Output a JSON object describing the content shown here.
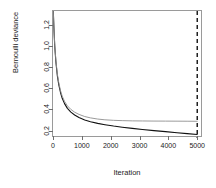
{
  "chart_data": {
    "type": "line",
    "title": "",
    "xlabel": "Iteration",
    "ylabel": "Bernoulli deviance",
    "xlim": [
      0,
      5200
    ],
    "ylim": [
      0.13,
      1.33
    ],
    "grid": false,
    "legend": "none",
    "xticks": [
      0,
      1000,
      2000,
      3000,
      4000,
      5000
    ],
    "xticklabels": [
      "0",
      "1000",
      "2000",
      "3000",
      "4000",
      "5000"
    ],
    "yticks": [
      0.2,
      0.4,
      0.6,
      0.8,
      1.0,
      1.2
    ],
    "yticklabels": [
      "0.2",
      "0.4",
      "0.6",
      "0.8",
      "1.0",
      "1.2"
    ],
    "annotations": [
      {
        "name": "vertical-dashed-line",
        "type": "vline",
        "x": 5000,
        "style": "dashed",
        "color": "#111111"
      }
    ],
    "series": [
      {
        "name": "train-deviance",
        "color": "#111111",
        "width": 1.1,
        "style": "solid",
        "x": [
          10,
          30,
          60,
          100,
          150,
          200,
          260,
          320,
          400,
          500,
          620,
          750,
          900,
          1100,
          1300,
          1550,
          1800,
          2100,
          2400,
          2750,
          3100,
          3500,
          3900,
          4300,
          4650,
          5000
        ],
        "y": [
          1.33,
          1.18,
          1.0,
          0.85,
          0.72,
          0.635,
          0.56,
          0.505,
          0.455,
          0.41,
          0.375,
          0.347,
          0.323,
          0.3,
          0.284,
          0.268,
          0.256,
          0.243,
          0.232,
          0.221,
          0.211,
          0.2,
          0.19,
          0.18,
          0.171,
          0.163
        ]
      },
      {
        "name": "cv-deviance",
        "color": "#8f8f8f",
        "width": 0.9,
        "style": "solid",
        "x": [
          10,
          30,
          60,
          100,
          150,
          200,
          260,
          320,
          400,
          500,
          620,
          750,
          900,
          1100,
          1300,
          1550,
          1800,
          2100,
          2400,
          2750,
          3100,
          3500,
          3900,
          4300,
          4650,
          5000
        ],
        "y": [
          1.33,
          1.185,
          1.01,
          0.862,
          0.735,
          0.652,
          0.578,
          0.525,
          0.476,
          0.434,
          0.4,
          0.374,
          0.353,
          0.333,
          0.32,
          0.309,
          0.302,
          0.297,
          0.294,
          0.292,
          0.291,
          0.29,
          0.2895,
          0.289,
          0.2885,
          0.288
        ]
      }
    ]
  }
}
